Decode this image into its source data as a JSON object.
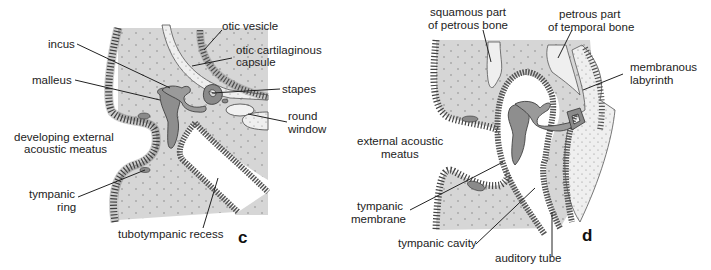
{
  "figure": {
    "colors": {
      "mesenchyme": "#d9d9d9",
      "ossicle": "#8c8c8c",
      "epithelium_dark": "#7a7a7a",
      "cartilage": "#ececec",
      "outline": "#333333"
    }
  },
  "panels": [
    {
      "id": "c",
      "letter": "c",
      "labels": {
        "incus": "incus",
        "malleus": "malleus",
        "developing_eam_1": "developing external",
        "developing_eam_2": "acoustic meatus",
        "tympanic_ring_1": "tympanic",
        "tympanic_ring_2": "ring",
        "tubotympanic_recess": "tubotympanic recess",
        "otic_vesicle": "otic vesicle",
        "otic_capsule_1": "otic cartilaginous",
        "otic_capsule_2": "capsule",
        "stapes": "stapes",
        "round_window_1": "round",
        "round_window_2": "window"
      }
    },
    {
      "id": "d",
      "letter": "d",
      "labels": {
        "squamous_1": "squamous part",
        "squamous_2": "of petrous bone",
        "petrous_1": "petrous part",
        "petrous_2": "of temporal bone",
        "membranous_labyrinth_1": "membranous",
        "membranous_labyrinth_2": "labyrinth",
        "eam_1": "external acoustic",
        "eam_2": "meatus",
        "tympanic_membrane_1": "tympanic",
        "tympanic_membrane_2": "membrane",
        "tympanic_cavity": "tympanic cavity",
        "auditory_tube": "auditory tube"
      }
    }
  ]
}
